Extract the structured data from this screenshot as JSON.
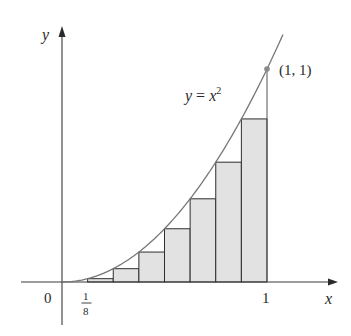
{
  "figure": {
    "function_label": "y = x",
    "function_label_parts": {
      "lhs": "y",
      "eq": " = ",
      "base": "x",
      "exp": "2"
    },
    "point_label": "(1, 1)",
    "origin_label": "0",
    "x_axis_label": "x",
    "y_axis_label": "y",
    "tick_one_label": "1",
    "tick_fraction": {
      "numerator": "1",
      "denominator": "8"
    }
  },
  "colors": {
    "curve": "#777777",
    "axis": "#3a3a3a",
    "rect_fill": "#e2e2e2",
    "rect_stroke": "#2e2e2e",
    "point": "#8a8a8a",
    "text": "#2a2a2a"
  },
  "chart_data": {
    "type": "diagram",
    "title": "",
    "function": "y = x^2",
    "interval": [
      0,
      1
    ],
    "n": 8,
    "rule": "left endpoint (lower sum)",
    "rectangles": [
      {
        "x_left": 0.125,
        "x_right": 0.25,
        "height": 0.015625
      },
      {
        "x_left": 0.25,
        "x_right": 0.375,
        "height": 0.0625
      },
      {
        "x_left": 0.375,
        "x_right": 0.5,
        "height": 0.140625
      },
      {
        "x_left": 0.5,
        "x_right": 0.625,
        "height": 0.25
      },
      {
        "x_left": 0.625,
        "x_right": 0.75,
        "height": 0.390625
      },
      {
        "x_left": 0.75,
        "x_right": 0.875,
        "height": 0.5625
      },
      {
        "x_left": 0.875,
        "x_right": 1.0,
        "height": 0.765625
      }
    ],
    "marked_point": {
      "x": 1,
      "y": 1,
      "label": "(1, 1)"
    },
    "xlabel": "x",
    "ylabel": "y",
    "x_ticks": [
      "0",
      "1/8",
      "1"
    ],
    "grid": false
  }
}
